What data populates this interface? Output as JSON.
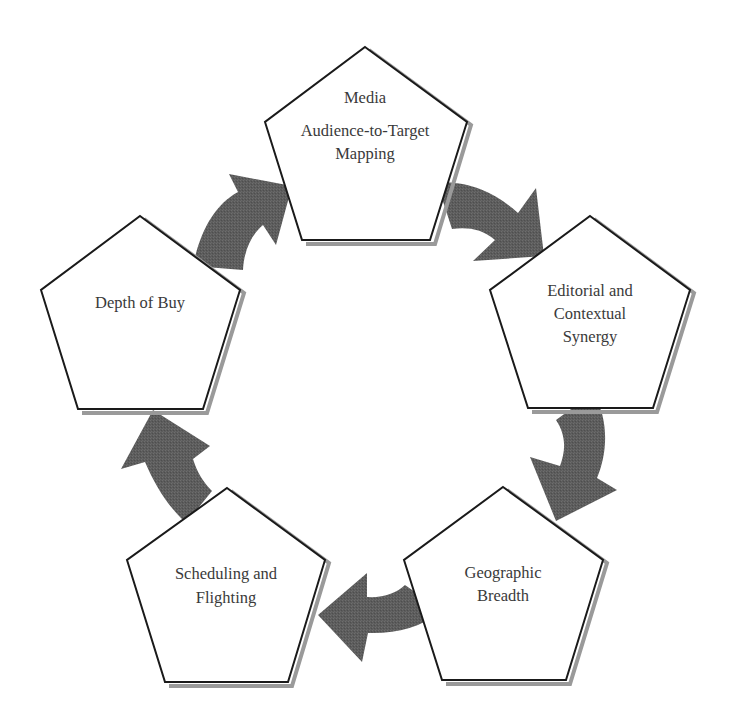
{
  "diagram": {
    "type": "cycle",
    "colors": {
      "stroke": "#1a1a1a",
      "shadow": "#9a9a9a",
      "arrow": "#5a5a5a",
      "text": "#3a3a3a",
      "background": "#ffffff"
    },
    "nodes": [
      {
        "id": "media",
        "lines": [
          "Media",
          "Audience-to-Target",
          "Mapping"
        ]
      },
      {
        "id": "editorial",
        "lines": [
          "Editorial and",
          "Contextual",
          "Synergy"
        ]
      },
      {
        "id": "geographic",
        "lines": [
          "Geographic",
          "Breadth"
        ]
      },
      {
        "id": "scheduling",
        "lines": [
          "Scheduling and",
          "Flighting"
        ]
      },
      {
        "id": "depth",
        "lines": [
          "Depth of Buy"
        ]
      }
    ],
    "edges": [
      {
        "from": "depth",
        "to": "media",
        "icon": "curved-arrow-icon"
      },
      {
        "from": "media",
        "to": "editorial",
        "icon": "curved-arrow-icon"
      },
      {
        "from": "editorial",
        "to": "geographic",
        "icon": "curved-arrow-icon"
      },
      {
        "from": "geographic",
        "to": "scheduling",
        "icon": "curved-arrow-icon"
      },
      {
        "from": "scheduling",
        "to": "depth",
        "icon": "curved-arrow-icon"
      }
    ]
  }
}
